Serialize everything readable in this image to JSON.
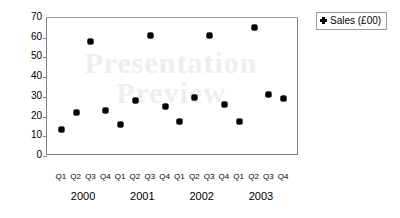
{
  "chart_data": {
    "type": "scatter",
    "title": "",
    "xlabel": "",
    "ylabel": "Sales",
    "ylim": [
      0,
      70
    ],
    "yticks": [
      0,
      10,
      20,
      30,
      40,
      50,
      60,
      70
    ],
    "grid": false,
    "legend_position": "right",
    "categories": [
      "Q1",
      "Q2",
      "Q3",
      "Q4",
      "Q1",
      "Q2",
      "Q3",
      "Q4",
      "Q1",
      "Q2",
      "Q3",
      "Q4",
      "Q1",
      "Q2",
      "Q3",
      "Q4"
    ],
    "group_labels": [
      "2000",
      "2001",
      "2002",
      "2003"
    ],
    "series": [
      {
        "name": "Sales (£00)",
        "marker": "diamond",
        "color": "#000000",
        "values": [
          13,
          22,
          58,
          23,
          15.5,
          28,
          61,
          25,
          17,
          29.5,
          61,
          26,
          17.5,
          65,
          31,
          29
        ]
      }
    ]
  },
  "legend": {
    "entries": [
      {
        "label": "Sales (£00)",
        "marker_name": "diamond-marker"
      }
    ]
  },
  "watermark": {
    "line1": "Presentation",
    "line2": "Preview"
  }
}
